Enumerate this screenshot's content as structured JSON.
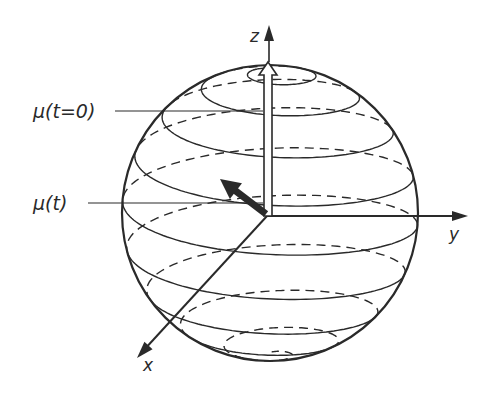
{
  "figure": {
    "colors": {
      "ink": "#2a2a2a",
      "background": "#ffffff"
    },
    "sphere": {
      "cx": 270,
      "cy": 213,
      "r": 148
    },
    "origin": {
      "x": 267,
      "y": 216
    },
    "axes": {
      "z": {
        "label": "z",
        "tip": [
          269,
          25
        ],
        "label_pos": [
          250,
          42
        ]
      },
      "y": {
        "label": "y",
        "tip": [
          468,
          216
        ],
        "label_pos": [
          449,
          240
        ]
      },
      "x": {
        "label": "x",
        "tip": [
          137,
          358
        ],
        "label_pos": [
          143,
          371
        ]
      }
    },
    "vectors": {
      "initial": {
        "label": "μ(t=0)",
        "label_pos": [
          33,
          118
        ],
        "leader_from": [
          115,
          111
        ],
        "leader_to": [
          263,
          111
        ],
        "tip": [
          268,
          62
        ],
        "style": "open-arrow"
      },
      "current": {
        "label": "μ(t)",
        "label_pos": [
          33,
          210
        ],
        "leader_from": [
          88,
          203
        ],
        "leader_to": [
          263,
          203
        ],
        "tip": [
          220,
          179
        ],
        "style": "filled-arrow"
      }
    },
    "spiral": {
      "turns": 9,
      "solid_front": true,
      "dashed_back": true
    }
  }
}
